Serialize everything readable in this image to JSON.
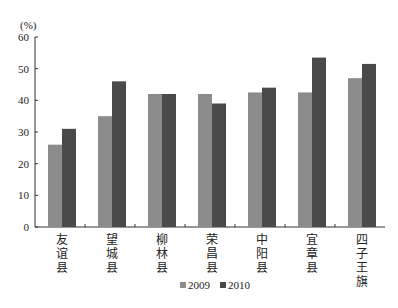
{
  "chart_data": {
    "type": "bar",
    "title": "",
    "xlabel": "",
    "ylabel": "(%)",
    "ylim": [
      0,
      60
    ],
    "yticks": [
      0,
      10,
      20,
      30,
      40,
      50,
      60
    ],
    "grid": false,
    "legend_position": "bottom",
    "categories": [
      "友谊县",
      "望城县",
      "柳林县",
      "荣昌县",
      "中阳县",
      "宜章县",
      "四子王旗"
    ],
    "series": [
      {
        "name": "2009",
        "color": "#8c8c8c",
        "values": [
          26,
          35,
          42,
          42,
          42.5,
          42.5,
          47
        ]
      },
      {
        "name": "2010",
        "color": "#4a4a4a",
        "values": [
          31,
          46,
          42,
          39,
          44,
          53.5,
          51.5
        ]
      }
    ]
  },
  "axis": {
    "unit_label": "(%)"
  },
  "legend": {
    "items": [
      {
        "label": "2009",
        "color": "#8c8c8c"
      },
      {
        "label": "2010",
        "color": "#4a4a4a"
      }
    ]
  }
}
